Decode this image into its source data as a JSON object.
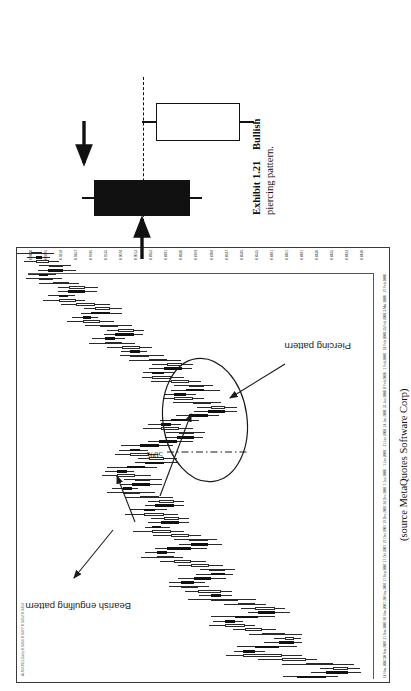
{
  "figure": {
    "caption_exhibit": "Exhibit 1.21",
    "caption_title": "Bullish",
    "caption_title2": "piercing pattern.",
    "source": "(source MetaQuotes Software Corp)"
  },
  "chart_panel": {
    "watermark": "AUD/USD,Daily  0.9366 0.9377 0.9352 0.9353",
    "annotations": [
      {
        "label": "Bearish engulfing pattern"
      },
      {
        "label": "Piercing pattern"
      },
      {
        "label": "50%"
      }
    ],
    "highlight_shape": "ellipse"
  },
  "schematic": {
    "name": "bullish-piercing-pattern-diagram",
    "candles": [
      {
        "type": "down",
        "fill": "#111111",
        "label": "black-candle"
      },
      {
        "type": "up",
        "fill": "#ffffff",
        "label": "white-candle"
      }
    ],
    "midline_label": "50% midpoint dashed line",
    "arrows": 2
  },
  "chart_data": {
    "type": "candlestick",
    "xlabel": "",
    "ylabel": "Price",
    "grid": false,
    "legend": null,
    "annotations": [
      {
        "text": "Bearish engulfing pattern",
        "points_to": [
          "bar 14",
          "bar 31",
          "bar 52"
        ]
      },
      {
        "text": "Piercing pattern",
        "points_to": [
          "bar 66"
        ]
      },
      {
        "text": "50%",
        "points_to": [
          "midpoint dashed line within piercing pattern"
        ]
      }
    ],
    "ylim": [
      0.842,
      0.944
    ],
    "yticks": [
      "0.9440",
      "0.9376",
      "0.9318",
      "0.9257",
      "0.9196",
      "0.9135",
      "0.9074",
      "0.9013",
      "0.8952",
      "0.8891",
      "0.8830",
      "0.8769",
      "0.8708",
      "0.8647",
      "0.8586",
      "0.8525",
      "0.8481",
      "0.8461",
      "0.8441",
      "0.8430",
      "0.8425",
      "0.8422",
      "0.8420"
    ],
    "xticks": [
      "14 Nov, 2007",
      "30 Nov 2007",
      "21 Nov 2007",
      "07 Nov 2007",
      "20 Nov 2007",
      "17 Sep 2007",
      "17 Oct 2007",
      "21 Dec 2007",
      "19 Dec 2007",
      "24 Dec 2007",
      "7 Jan 2008",
      "1 Jan 2008",
      "21 Jan 2008",
      "14 Jan 2008",
      "31 Jan 2008",
      "8 Feb 2008",
      "1 Feb 2008",
      "18 Feb 2008",
      "25 Feb 2008",
      "3 Mar 2008",
      "27 Feb 2008"
    ],
    "x": [
      1,
      2,
      3,
      4,
      5,
      6,
      7,
      8,
      9,
      10,
      11,
      12,
      13,
      14,
      15,
      16,
      17,
      18,
      19,
      20,
      21,
      22,
      23,
      24,
      25,
      26,
      27,
      28,
      29,
      30,
      31,
      32,
      33,
      34,
      35,
      36,
      37,
      38,
      39,
      40,
      41,
      42,
      43,
      44,
      45,
      46,
      47,
      48,
      49,
      50,
      51,
      52,
      53,
      54,
      55,
      56,
      57,
      58,
      59,
      60,
      61,
      62,
      63,
      64,
      65,
      66,
      67,
      68,
      69,
      70,
      71,
      72,
      73,
      74,
      75,
      76,
      77,
      78,
      79,
      80,
      81,
      82,
      83,
      84,
      85,
      86,
      87,
      88,
      89,
      90,
      91,
      92,
      93,
      94,
      95,
      96,
      97,
      98,
      99,
      100
    ],
    "open": [
      0.8645,
      0.856,
      0.8495,
      0.854,
      0.862,
      0.869,
      0.8805,
      0.877,
      0.87,
      0.8655,
      0.868,
      0.875,
      0.88,
      0.886,
      0.883,
      0.876,
      0.871,
      0.877,
      0.882,
      0.89,
      0.887,
      0.894,
      0.899,
      0.895,
      0.89,
      0.886,
      0.8905,
      0.896,
      0.901,
      0.906,
      0.903,
      0.896,
      0.891,
      0.8965,
      0.902,
      0.9075,
      0.905,
      0.8995,
      0.904,
      0.91,
      0.9065,
      0.901,
      0.9055,
      0.911,
      0.916,
      0.9135,
      0.908,
      0.9125,
      0.918,
      0.915,
      0.9095,
      0.904,
      0.9085,
      0.914,
      0.911,
      0.9055,
      0.9,
      0.895,
      0.8995,
      0.905,
      0.902,
      0.8965,
      0.891,
      0.886,
      0.89,
      0.8955,
      0.901,
      0.8975,
      0.892,
      0.8965,
      0.902,
      0.9075,
      0.904,
      0.8985,
      0.903,
      0.9085,
      0.914,
      0.911,
      0.9165,
      0.9215,
      0.9185,
      0.913,
      0.9175,
      0.923,
      0.928,
      0.9255,
      0.92,
      0.9245,
      0.93,
      0.935,
      0.9325,
      0.9275,
      0.932,
      0.937,
      0.941,
      0.9385,
      0.934,
      0.938,
      0.942,
      0.94
    ],
    "close": [
      0.856,
      0.8495,
      0.854,
      0.862,
      0.869,
      0.8805,
      0.877,
      0.87,
      0.8655,
      0.868,
      0.875,
      0.88,
      0.886,
      0.883,
      0.876,
      0.871,
      0.877,
      0.882,
      0.89,
      0.887,
      0.894,
      0.899,
      0.895,
      0.89,
      0.886,
      0.8905,
      0.896,
      0.901,
      0.906,
      0.903,
      0.896,
      0.891,
      0.8965,
      0.902,
      0.9075,
      0.905,
      0.8995,
      0.904,
      0.91,
      0.9065,
      0.901,
      0.9055,
      0.911,
      0.916,
      0.9135,
      0.908,
      0.9125,
      0.918,
      0.915,
      0.9095,
      0.904,
      0.9085,
      0.914,
      0.911,
      0.9055,
      0.9,
      0.895,
      0.8995,
      0.905,
      0.902,
      0.8965,
      0.891,
      0.886,
      0.89,
      0.8955,
      0.901,
      0.8975,
      0.892,
      0.8965,
      0.902,
      0.9075,
      0.904,
      0.8985,
      0.903,
      0.9085,
      0.914,
      0.911,
      0.9165,
      0.9215,
      0.9185,
      0.913,
      0.9175,
      0.923,
      0.928,
      0.9255,
      0.92,
      0.9245,
      0.93,
      0.935,
      0.9325,
      0.9275,
      0.932,
      0.937,
      0.941,
      0.9385,
      0.934,
      0.938,
      0.942,
      0.94,
      0.9435
    ]
  }
}
